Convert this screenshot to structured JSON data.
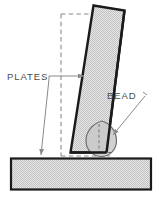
{
  "figure": {
    "type": "technical-line-diagram",
    "background_color": "#ffffff"
  },
  "labels": {
    "plates": "PLATES",
    "bead": "BEAD"
  },
  "colors": {
    "outline": "#1a1a1a",
    "hatch_fill": "#d6d6d6",
    "dashed_guide": "#8a8a8a",
    "leader_line": "#8a8a8a",
    "label_text": "#4a4a4a",
    "bead_outline": "#6e6e6e",
    "bead_fill": "#c9c9c9"
  },
  "parts": {
    "tilted_plate": {
      "name": "tilted plate",
      "fill": "#d6d6d6",
      "stroke": "#1a1a1a"
    },
    "base_plate": {
      "name": "base plate",
      "fill": "#d6d6d6",
      "stroke": "#1a1a1a"
    },
    "weld_bead": {
      "name": "weld bead",
      "fill": "#c9c9c9",
      "stroke": "#6e6e6e"
    },
    "reference_outline": {
      "name": "upright reference position",
      "style": "dashed"
    }
  },
  "annotations": [
    {
      "id": "plates-callout",
      "text": "PLATES",
      "points_to": [
        "tilted plate",
        "base plate"
      ],
      "leader_count": 2
    },
    {
      "id": "bead-callout",
      "text": "BEAD",
      "points_to": [
        "weld bead"
      ],
      "leader_count": 1
    }
  ]
}
